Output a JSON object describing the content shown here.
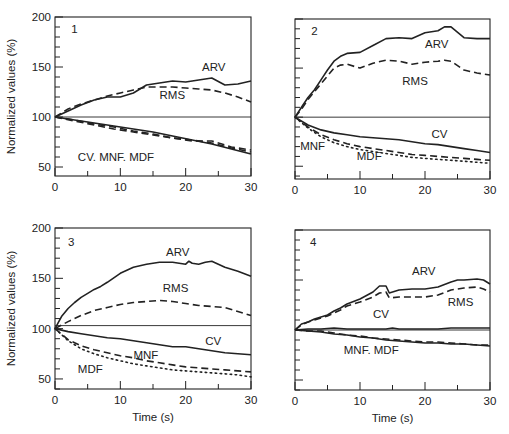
{
  "figure": {
    "width": 509,
    "height": 434,
    "ink_color": "#222222",
    "background": "#ffffff"
  },
  "chart_data": [
    {
      "type": "line",
      "panel_label": "1",
      "title": "",
      "xlabel": "",
      "ylabel": "Normalized values (%)",
      "xlim": [
        0,
        30
      ],
      "ylim": [
        41,
        200
      ],
      "xticks": [
        0,
        10,
        20,
        30
      ],
      "xminor": [
        5,
        15,
        25
      ],
      "yticks": [
        50,
        100,
        150,
        200
      ],
      "yminor_step": 10,
      "reference_line": 100,
      "grid": false,
      "box": {
        "left": 55,
        "top": 17,
        "right": 251,
        "bottom": 176
      },
      "show_ytick_labels": true,
      "show_xlabel": false,
      "series": [
        {
          "name": "ARV",
          "style": "solid",
          "x": [
            0,
            2,
            4,
            6,
            8,
            10,
            12,
            14,
            16,
            18,
            20,
            22,
            24,
            26,
            28,
            30
          ],
          "y": [
            100,
            106,
            112,
            117,
            120,
            120,
            124,
            132,
            134,
            136,
            135,
            137,
            139,
            132,
            133,
            136
          ]
        },
        {
          "name": "RMS",
          "style": "dashed",
          "x": [
            0,
            2,
            4,
            6,
            8,
            10,
            12,
            14,
            16,
            18,
            20,
            22,
            24,
            26,
            28,
            30
          ],
          "y": [
            100,
            108,
            113,
            117,
            121,
            124,
            127,
            130,
            130,
            130,
            129,
            128,
            127,
            124,
            120,
            115
          ]
        },
        {
          "name": "CV",
          "style": "solid",
          "x": [
            0,
            3,
            6,
            9,
            12,
            15,
            18,
            21,
            24,
            27,
            30
          ],
          "y": [
            100,
            97,
            94,
            91,
            88,
            85,
            81,
            77,
            73,
            68,
            63
          ]
        },
        {
          "name": "MNF",
          "style": "dashed",
          "x": [
            0,
            3,
            6,
            9,
            12,
            15,
            18,
            21,
            24,
            27,
            30
          ],
          "y": [
            100,
            97,
            93,
            90,
            86,
            83,
            79,
            77,
            74,
            69,
            65
          ]
        },
        {
          "name": "MDF",
          "style": "dashed",
          "x": [
            0,
            3,
            6,
            9,
            12,
            15,
            18,
            21,
            24,
            27,
            30
          ],
          "y": [
            100,
            96,
            92,
            88,
            85,
            82,
            79,
            76,
            76,
            70,
            67
          ]
        }
      ],
      "annotations": [
        {
          "text": "1",
          "x": 2.5,
          "y": 184
        },
        {
          "text": "ARV",
          "x": 22.5,
          "y": 146
        },
        {
          "text": "RMS",
          "x": 16,
          "y": 118
        },
        {
          "text": "CV. MNF. MDF",
          "x": 3.5,
          "y": 56
        }
      ]
    },
    {
      "type": "line",
      "panel_label": "2",
      "title": "",
      "xlabel": "",
      "ylabel": "",
      "xlim": [
        0,
        30
      ],
      "ylim": [
        37,
        200
      ],
      "xticks": [
        0,
        10,
        20,
        30
      ],
      "xminor": [
        5,
        15,
        25
      ],
      "yticks": [],
      "yminor_step": 10,
      "reference_line": 100,
      "grid": false,
      "box": {
        "left": 295,
        "top": 19,
        "right": 490,
        "bottom": 179
      },
      "show_ytick_labels": false,
      "show_xlabel": false,
      "series": [
        {
          "name": "ARV",
          "style": "solid",
          "x": [
            0,
            1,
            2,
            3,
            4,
            5,
            6,
            7,
            8,
            10,
            12,
            14,
            16,
            18,
            20,
            22,
            23,
            24,
            26,
            28,
            30
          ],
          "y": [
            100,
            110,
            120,
            128,
            138,
            148,
            157,
            162,
            165,
            166,
            173,
            180,
            181,
            180,
            186,
            188,
            192,
            192,
            181,
            180,
            180
          ]
        },
        {
          "name": "RMS",
          "style": "dashed",
          "x": [
            0,
            1,
            2,
            3,
            4,
            5,
            6,
            7,
            8,
            10,
            12,
            14,
            16,
            18,
            20,
            22,
            23,
            24,
            26,
            28,
            30
          ],
          "y": [
            100,
            108,
            118,
            126,
            134,
            142,
            150,
            153,
            154,
            150,
            155,
            158,
            157,
            154,
            156,
            157,
            158,
            157,
            148,
            145,
            143
          ]
        },
        {
          "name": "CV",
          "style": "solid",
          "x": [
            0,
            2,
            4,
            6,
            8,
            10,
            12,
            14,
            16,
            18,
            20,
            22,
            24,
            26,
            28,
            30
          ],
          "y": [
            100,
            92,
            87,
            84,
            82,
            80,
            79,
            78,
            77,
            75,
            73,
            72,
            70,
            68,
            66,
            64
          ]
        },
        {
          "name": "MNF",
          "style": "dashed",
          "x": [
            0,
            2,
            4,
            6,
            8,
            10,
            12,
            14,
            16,
            18,
            20,
            22,
            24,
            26,
            28,
            30
          ],
          "y": [
            100,
            90,
            82,
            77,
            73,
            70,
            68,
            66,
            64,
            62,
            61,
            60,
            59,
            58,
            57,
            56
          ]
        },
        {
          "name": "MDF",
          "style": "dotted",
          "x": [
            0,
            2,
            4,
            6,
            8,
            10,
            12,
            14,
            16,
            18,
            20,
            22,
            24,
            26,
            28,
            30
          ],
          "y": [
            100,
            89,
            80,
            74,
            70,
            67,
            65,
            63,
            61,
            59,
            58,
            57,
            56,
            55,
            54,
            53
          ]
        }
      ],
      "annotations": [
        {
          "text": "2",
          "x": 2.5,
          "y": 184
        },
        {
          "text": "ARV",
          "x": 20,
          "y": 170
        },
        {
          "text": "RMS",
          "x": 16.5,
          "y": 133
        },
        {
          "text": "CV",
          "x": 21,
          "y": 79
        },
        {
          "text": "MNF",
          "x": 0.8,
          "y": 67
        },
        {
          "text": "MDF",
          "x": 9.5,
          "y": 56
        }
      ]
    },
    {
      "type": "line",
      "panel_label": "3",
      "title": "",
      "xlabel": "Time (s)",
      "ylabel": "Normalized values (%)",
      "xlim": [
        0,
        30
      ],
      "ylim": [
        40,
        200
      ],
      "xticks": [
        0,
        10,
        20,
        30
      ],
      "xminor": [
        5,
        15,
        25
      ],
      "yticks": [
        50,
        100,
        150,
        200
      ],
      "yminor_step": 10,
      "reference_line": 103,
      "grid": false,
      "box": {
        "left": 55,
        "top": 228,
        "right": 251,
        "bottom": 389
      },
      "show_ytick_labels": true,
      "show_xlabel": true,
      "series": [
        {
          "name": "ARV",
          "style": "solid",
          "x": [
            0,
            1,
            2,
            3,
            4,
            5,
            6,
            7,
            8,
            10,
            12,
            14,
            16,
            18,
            20,
            20.5,
            21,
            22,
            23,
            24,
            26,
            28,
            30
          ],
          "y": [
            100,
            112,
            120,
            126,
            131,
            135,
            139,
            142,
            146,
            155,
            161,
            164,
            166,
            166,
            164,
            167,
            165,
            164,
            166,
            167,
            161,
            157,
            152
          ]
        },
        {
          "name": "RMS",
          "style": "dashed",
          "x": [
            0,
            2,
            4,
            6,
            8,
            10,
            12,
            14,
            16,
            18,
            20,
            22,
            24,
            26,
            28,
            30
          ],
          "y": [
            100,
            107,
            113,
            118,
            121,
            124,
            126,
            127,
            128,
            127,
            125,
            123,
            122,
            121,
            117,
            113
          ]
        },
        {
          "name": "CV",
          "style": "solid",
          "x": [
            0,
            2,
            4,
            6,
            8,
            10,
            12,
            14,
            16,
            18,
            20,
            22,
            24,
            26,
            28,
            30
          ],
          "y": [
            100,
            97,
            95,
            93,
            91,
            90,
            88,
            86,
            84,
            82,
            82,
            80,
            78,
            76,
            75,
            74
          ]
        },
        {
          "name": "MNF",
          "style": "dashed",
          "x": [
            0,
            2,
            4,
            6,
            8,
            10,
            12,
            14,
            16,
            18,
            20,
            22,
            24,
            26,
            28,
            30
          ],
          "y": [
            100,
            89,
            83,
            79,
            76,
            73,
            71,
            68,
            66,
            64,
            62,
            61,
            60,
            59,
            58,
            57
          ]
        },
        {
          "name": "MDF",
          "style": "dotted",
          "x": [
            0,
            2,
            4,
            6,
            8,
            10,
            12,
            14,
            16,
            18,
            20,
            22,
            24,
            26,
            28,
            30
          ],
          "y": [
            100,
            88,
            80,
            75,
            71,
            68,
            65,
            63,
            61,
            59,
            58,
            57,
            56,
            55,
            54,
            52
          ]
        }
      ],
      "annotations": [
        {
          "text": "3",
          "x": 2.0,
          "y": 182
        },
        {
          "text": "ARV",
          "x": 17,
          "y": 172
        },
        {
          "text": "RMS",
          "x": 16.5,
          "y": 136
        },
        {
          "text": "CV",
          "x": 23,
          "y": 84
        },
        {
          "text": "MNF",
          "x": 12,
          "y": 70
        },
        {
          "text": "MDF",
          "x": 3.5,
          "y": 56
        }
      ]
    },
    {
      "type": "line",
      "panel_label": "4",
      "title": "",
      "xlabel": "Time (s)",
      "ylabel": "",
      "xlim": [
        0,
        30
      ],
      "ylim": [
        40,
        200
      ],
      "xticks": [
        0,
        10,
        20,
        30
      ],
      "xminor": [
        5,
        15,
        25
      ],
      "yticks": [],
      "yminor_step": 10,
      "reference_line": 100,
      "grid": false,
      "box": {
        "left": 295,
        "top": 230,
        "right": 490,
        "bottom": 390
      },
      "show_ytick_labels": false,
      "show_xlabel": true,
      "series": [
        {
          "name": "ARV",
          "style": "solid",
          "x": [
            0,
            1,
            2,
            3,
            4,
            5,
            6,
            7,
            8,
            10,
            12,
            13,
            14,
            14.5,
            16,
            18,
            20,
            22,
            24,
            25,
            26,
            28,
            29,
            30
          ],
          "y": [
            100,
            106,
            108,
            111,
            113,
            115,
            119,
            122,
            126,
            131,
            138,
            144,
            144,
            137,
            140,
            141,
            141,
            143,
            148,
            150,
            150,
            151,
            150,
            146
          ]
        },
        {
          "name": "RMS",
          "style": "dashed",
          "x": [
            0,
            1,
            2,
            3,
            4,
            5,
            6,
            7,
            8,
            10,
            12,
            13,
            14,
            14.5,
            16,
            18,
            20,
            22,
            24,
            26,
            28,
            29,
            30
          ],
          "y": [
            100,
            105,
            108,
            110,
            112,
            114,
            117,
            120,
            124,
            128,
            133,
            137,
            138,
            132,
            133,
            133,
            133,
            135,
            140,
            142,
            143,
            141,
            138
          ]
        },
        {
          "name": "CV",
          "style": "solid",
          "x": [
            0,
            2,
            4,
            6,
            8,
            10,
            12,
            14,
            15,
            16,
            18,
            20,
            22,
            24,
            26,
            28,
            30
          ],
          "y": [
            100,
            101,
            101,
            102,
            101,
            101,
            101,
            101,
            102,
            101,
            101,
            101,
            101,
            102,
            102,
            102,
            102
          ]
        },
        {
          "name": "MNF",
          "style": "dashed",
          "x": [
            0,
            2,
            4,
            6,
            8,
            10,
            12,
            14,
            16,
            18,
            20,
            22,
            24,
            26,
            28,
            30
          ],
          "y": [
            100,
            99,
            99,
            97,
            95,
            94,
            92,
            91,
            90,
            89,
            88,
            88,
            87,
            86,
            85,
            85
          ]
        },
        {
          "name": "MDF",
          "style": "solid",
          "x": [
            0,
            2,
            4,
            6,
            8,
            10,
            12,
            14,
            16,
            18,
            20,
            22,
            24,
            26,
            28,
            30
          ],
          "y": [
            100,
            99,
            98,
            96,
            95,
            93,
            92,
            90,
            89,
            88,
            87,
            87,
            86,
            86,
            85,
            84
          ]
        }
      ],
      "annotations": [
        {
          "text": "4",
          "x": 2.3,
          "y": 184
        },
        {
          "text": "ARV",
          "x": 18,
          "y": 155
        },
        {
          "text": "RMS",
          "x": 23.5,
          "y": 124
        },
        {
          "text": "CV",
          "x": 12,
          "y": 112
        },
        {
          "text": "MNF. MDF",
          "x": 7.5,
          "y": 76
        }
      ]
    }
  ]
}
